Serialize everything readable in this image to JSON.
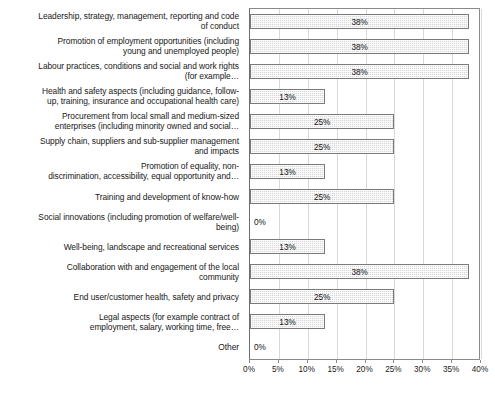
{
  "chart_data": {
    "type": "bar",
    "orientation": "horizontal",
    "title": "",
    "xlabel": "",
    "ylabel": "",
    "xlim": [
      0,
      40
    ],
    "xtick_labels": [
      "0%",
      "5%",
      "10%",
      "15%",
      "20%",
      "25%",
      "30%",
      "35%",
      "40%"
    ],
    "xtick_values": [
      0,
      5,
      10,
      15,
      20,
      25,
      30,
      35,
      40
    ],
    "grid": true,
    "legend": "none",
    "value_suffix": "%",
    "categories": [
      "Leadership, strategy, management, reporting and code of conduct",
      "Promotion of employment opportunities (including young and unemployed people)",
      "Labour practices, conditions and social and work rights (for example…",
      "Health and safety aspects (including guidance, follow-up, training, insurance and occupational health care)",
      "Procurement from local small and medium-sized enterprises (including minority owned and social…",
      "Supply chain, suppliers and sub-supplier management and impacts",
      "Promotion of equality, non-discrimination, accessibility, equal opportunity and…",
      "Training and development of know-how",
      "Social innovations (including promotion of welfare/well-being)",
      "Well-being, landscape and recreational services",
      "Collaboration with and engagement of the local community",
      "End user/customer health, safety and privacy",
      "Legal aspects (for example contract of employment, salary, working time, free…",
      "Other"
    ],
    "category_lines": [
      [
        "Leadership, strategy, management, reporting and code",
        "of conduct"
      ],
      [
        "Promotion of employment opportunities (including",
        "young and unemployed people)"
      ],
      [
        "Labour practices, conditions and social and work rights",
        "(for example…"
      ],
      [
        "Health and safety aspects (including guidance, follow-",
        "up, training, insurance and occupational health care)"
      ],
      [
        "Procurement from local small and medium-sized",
        "enterprises (including minority owned and social…"
      ],
      [
        "Supply chain, suppliers and sub-supplier management",
        "and impacts"
      ],
      [
        "Promotion of equality, non-",
        "discrimination, accessibility, equal opportunity and…"
      ],
      [
        "Training and development of know-how"
      ],
      [
        "Social innovations (including promotion of welfare/well-",
        "being)"
      ],
      [
        "Well-being, landscape and recreational services"
      ],
      [
        "Collaboration with and engagement of the local",
        "community"
      ],
      [
        "End user/customer health, safety and privacy"
      ],
      [
        "Legal aspects (for example contract of",
        "employment, salary, working time, free…"
      ],
      [
        "Other"
      ]
    ],
    "values": [
      38,
      38,
      38,
      13,
      25,
      25,
      13,
      25,
      0,
      13,
      38,
      25,
      13,
      0
    ],
    "value_labels": [
      "38%",
      "38%",
      "38%",
      "13%",
      "25%",
      "25%",
      "13%",
      "25%",
      "0%",
      "13%",
      "38%",
      "25%",
      "13%",
      "0%"
    ],
    "colors": {
      "bar_fill": "#d7d7d7",
      "bar_border": "#7a7a7a",
      "gridline": "#d9d9d9",
      "axis": "#8a8a8a",
      "text": "#1a1a1a",
      "background": "#ffffff"
    }
  }
}
